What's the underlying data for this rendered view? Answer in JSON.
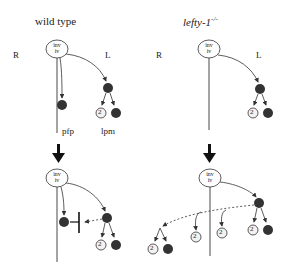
{
  "panels": {
    "wild_type": {
      "title": "wild type",
      "side_right": "R",
      "side_left": "L",
      "node_top": "inv",
      "node_bottom": "iv",
      "label_midline": "pfp",
      "label_lateral": "lpm"
    },
    "mutant": {
      "title_main": "lefty-1",
      "title_sup": "-/-",
      "side_right": "R",
      "side_left": "L",
      "node_top": "inv",
      "node_bottom": "iv"
    }
  },
  "nodes": {
    "open_label": "2"
  },
  "colors": {
    "dark_node": "#333333",
    "light_node": "#f2f2f2",
    "line": "#333333"
  }
}
